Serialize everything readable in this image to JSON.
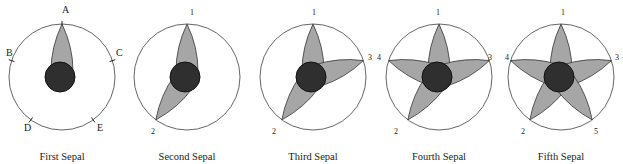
{
  "colors": {
    "outline": "#555555",
    "petal_fill": "#a6a6a6",
    "petal_stroke": "#333333",
    "center_fill": "#2f2f2f",
    "text": "#222222"
  },
  "panels": [
    {
      "caption": "First Sepal",
      "labels": [
        {
          "text": "A",
          "x": 62,
          "y": 13
        },
        {
          "text": "B",
          "x": 6,
          "y": 56
        },
        {
          "text": "C",
          "x": 116,
          "y": 56
        },
        {
          "text": "D",
          "x": 24,
          "y": 131
        },
        {
          "text": "E",
          "x": 97,
          "y": 131
        }
      ],
      "petal_angles": [
        0
      ]
    },
    {
      "caption": "Second Sepal",
      "labels": [
        {
          "text": "1",
          "x": 65,
          "y": 15
        },
        {
          "text": "2",
          "x": 26,
          "y": 134
        }
      ],
      "petal_angles": [
        0,
        216
      ]
    },
    {
      "caption": "Third Sepal",
      "labels": [
        {
          "text": "1",
          "x": 61,
          "y": 15
        },
        {
          "text": "3",
          "x": 117,
          "y": 60
        },
        {
          "text": "2",
          "x": 21,
          "y": 134
        }
      ],
      "petal_angles": [
        0,
        216,
        72
      ]
    },
    {
      "caption": "Fourth Sepal",
      "labels": [
        {
          "text": "1",
          "x": 59,
          "y": 15
        },
        {
          "text": "3",
          "x": 111,
          "y": 60
        },
        {
          "text": "4",
          "x": 0,
          "y": 60
        },
        {
          "text": "2",
          "x": 17,
          "y": 134
        }
      ],
      "petal_angles": [
        0,
        216,
        72,
        288
      ]
    },
    {
      "caption": "Fifth Sepal",
      "labels": [
        {
          "text": "1",
          "x": 62,
          "y": 15
        },
        {
          "text": "3",
          "x": 116,
          "y": 60
        },
        {
          "text": "4",
          "x": 6,
          "y": 60
        },
        {
          "text": "2",
          "x": 22,
          "y": 134
        },
        {
          "text": "5",
          "x": 95,
          "y": 134
        }
      ],
      "petal_angles": [
        0,
        216,
        72,
        288,
        144
      ]
    }
  ]
}
